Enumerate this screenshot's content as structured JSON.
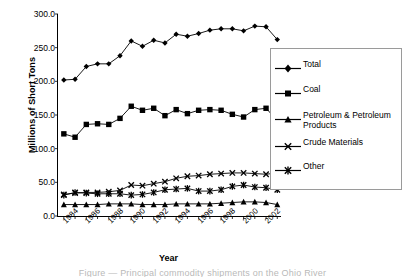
{
  "chart_data": {
    "type": "line",
    "title": "",
    "xlabel": "Year",
    "ylabel": "Millions of Short Tons",
    "ylim": [
      0,
      300
    ],
    "ytick_labels": [
      "300.0",
      "250.0",
      "200.0",
      "150.0",
      "100.0",
      "50.0",
      "0.0"
    ],
    "yticks": [
      300,
      250,
      200,
      150,
      100,
      50,
      0
    ],
    "grid": false,
    "legend_position": "right",
    "x": [
      1984,
      1985,
      1986,
      1987,
      1988,
      1989,
      1990,
      1991,
      1992,
      1993,
      1994,
      1995,
      1996,
      1997,
      1998,
      1999,
      2000,
      2001,
      2002,
      2003
    ],
    "xtick_labels": [
      "1984",
      "1986",
      "1988",
      "1990",
      "1992",
      "1994",
      "1996",
      "1998",
      "2000",
      "2002"
    ],
    "xticks": [
      1984,
      1986,
      1988,
      1990,
      1992,
      1994,
      1996,
      1998,
      2000,
      2002
    ],
    "series": [
      {
        "name": "Total",
        "marker": "diamond",
        "values": [
          202,
          203,
          222,
          226,
          226,
          238,
          260,
          252,
          261,
          257,
          270,
          267,
          271,
          276,
          278,
          278,
          275,
          282,
          281,
          262
        ]
      },
      {
        "name": "Coal",
        "marker": "square",
        "values": [
          122,
          117,
          136,
          137,
          136,
          145,
          163,
          157,
          160,
          149,
          158,
          152,
          157,
          158,
          157,
          151,
          147,
          158,
          160,
          142
        ]
      },
      {
        "name": "Petroleum & Petroleum Products",
        "marker": "triangle",
        "values": [
          17,
          17,
          17,
          17,
          18,
          18,
          18,
          17,
          17,
          17,
          18,
          18,
          18,
          18,
          19,
          20,
          21,
          21,
          20,
          17
        ]
      },
      {
        "name": "Crude Materials",
        "marker": "cross",
        "values": [
          32,
          34,
          35,
          35,
          36,
          38,
          46,
          45,
          48,
          51,
          56,
          59,
          60,
          62,
          63,
          64,
          64,
          63,
          62,
          64
        ]
      },
      {
        "name": "Other",
        "marker": "asterisk",
        "values": [
          31,
          35,
          34,
          33,
          33,
          33,
          31,
          32,
          35,
          39,
          40,
          41,
          37,
          37,
          39,
          44,
          46,
          43,
          42,
          39
        ]
      }
    ]
  },
  "chart": {
    "ylabel": "Millions of Short Tons",
    "xlabel": "Year"
  },
  "legend": {
    "items": [
      {
        "label": "Total"
      },
      {
        "label": "Coal"
      },
      {
        "label": "Petroleum & Petroleum"
      },
      {
        "label": "Products"
      },
      {
        "label": "Crude Materials"
      },
      {
        "label": "Other"
      }
    ]
  },
  "caption": {
    "text": "Figure — Principal commodity shipments on the Ohio River"
  },
  "colors": {
    "series": "#000000",
    "axis": "#000000",
    "legend_border": "#9a9a9a"
  }
}
